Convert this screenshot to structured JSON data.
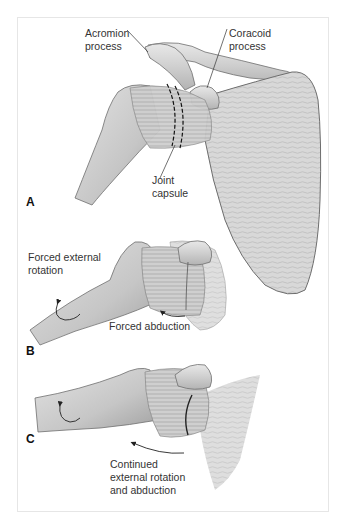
{
  "figure": {
    "panels": [
      {
        "letter": "A",
        "labels": {
          "acromion": "Acromion\nprocess",
          "coracoid": "Coracoid\nprocess",
          "capsule": "Joint\ncapsule"
        }
      },
      {
        "letter": "B",
        "labels": {
          "rotation": "Forced external\nrotation",
          "abduction": "Forced abduction"
        }
      },
      {
        "letter": "C",
        "labels": {
          "continued": "Continued\nexternal rotation\nand abduction"
        }
      }
    ],
    "colors": {
      "bone_fill": "#d9d9d9",
      "bone_shade": "#a8a8a8",
      "outline": "#6e6e6e",
      "frame": "#e6e6e6",
      "text": "#333333"
    }
  }
}
